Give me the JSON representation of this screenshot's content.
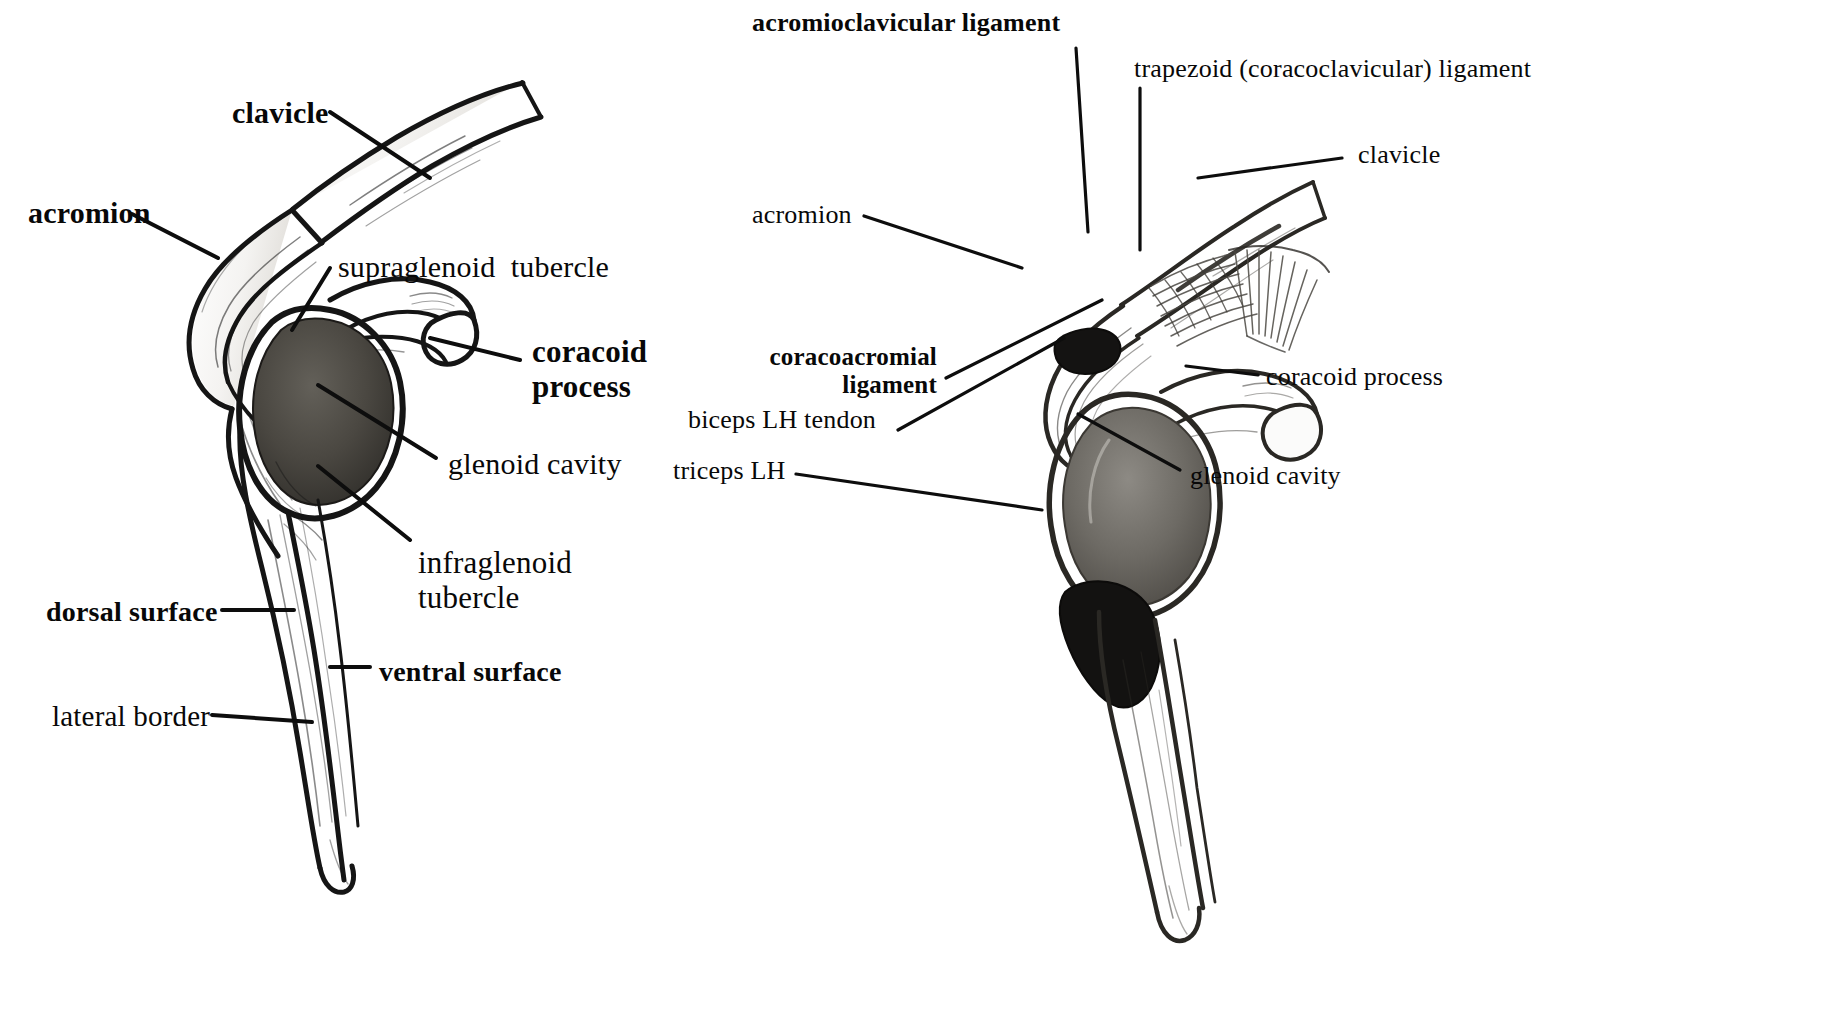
{
  "page": {
    "width": 1826,
    "height": 1022,
    "background_color": "#ffffff",
    "ink_color": "#111111"
  },
  "figures": [
    {
      "id": "left",
      "name": "scapula-bone-lateral-view",
      "caption": "Scapula with clavicle, lateral view (bone only)",
      "labels": [
        {
          "id": "clavicle",
          "text": "clavicle",
          "weight": "bold",
          "x": 232,
          "y": 96,
          "align": "left"
        },
        {
          "id": "acromion",
          "text": "acromion",
          "weight": "bold",
          "x": 28,
          "y": 196,
          "align": "left"
        },
        {
          "id": "supraglenoid-tubercle",
          "text": "supraglenoid  tubercle",
          "weight": "normal",
          "x": 338,
          "y": 250,
          "align": "left"
        },
        {
          "id": "coracoid-process",
          "text": "coracoid\nprocess",
          "weight": "bold",
          "x": 532,
          "y": 335,
          "align": "left"
        },
        {
          "id": "glenoid-cavity",
          "text": "glenoid cavity",
          "weight": "normal",
          "x": 448,
          "y": 447,
          "align": "left"
        },
        {
          "id": "infraglenoid-tubercle",
          "text": "infraglenoid\ntubercle",
          "weight": "normal",
          "x": 418,
          "y": 546,
          "align": "left"
        },
        {
          "id": "dorsal-surface",
          "text": "dorsal surface",
          "weight": "bold",
          "x": 46,
          "y": 596,
          "align": "left"
        },
        {
          "id": "ventral-surface",
          "text": "ventral surface",
          "weight": "bold",
          "x": 379,
          "y": 656,
          "align": "left"
        },
        {
          "id": "lateral-border",
          "text": "lateral border",
          "weight": "normal",
          "x": 52,
          "y": 700,
          "align": "left"
        }
      ]
    },
    {
      "id": "right",
      "name": "scapula-with-ligaments-lateral-view",
      "caption": "Scapula with clavicle and associated ligaments and tendons",
      "labels": [
        {
          "id": "acromioclavicular-ligament",
          "text": "acromioclavicular ligament",
          "weight": "bold",
          "x": 752,
          "y": 8,
          "align": "left"
        },
        {
          "id": "trapezoid-ligament",
          "text": "trapezoid (coracoclavicular) ligament",
          "weight": "normal",
          "x": 1134,
          "y": 54,
          "align": "left"
        },
        {
          "id": "clavicle",
          "text": "clavicle",
          "weight": "normal",
          "x": 1358,
          "y": 140,
          "align": "left"
        },
        {
          "id": "acromion",
          "text": "acromion",
          "weight": "normal",
          "x": 752,
          "y": 200,
          "align": "left"
        },
        {
          "id": "coracoacromial-ligament",
          "text": "coracoacromial\nligament",
          "weight": "bold",
          "x": 757,
          "y": 343,
          "align": "right"
        },
        {
          "id": "biceps-lh-tendon",
          "text": "biceps LH tendon",
          "weight": "normal",
          "x": 688,
          "y": 405,
          "align": "left"
        },
        {
          "id": "triceps-lh",
          "text": "triceps LH",
          "weight": "normal",
          "x": 673,
          "y": 456,
          "align": "left"
        },
        {
          "id": "coracoid-process",
          "text": "coracoid process",
          "weight": "normal",
          "x": 1266,
          "y": 362,
          "align": "left"
        },
        {
          "id": "glenoid-cavity",
          "text": "glenoid cavity",
          "weight": "normal",
          "x": 1190,
          "y": 461,
          "align": "left"
        }
      ]
    }
  ],
  "leader_lines": {
    "count": 18,
    "stroke_color": "#111111",
    "description": "Straight black pointer lines connecting each text label to the anatomical structure it names."
  }
}
